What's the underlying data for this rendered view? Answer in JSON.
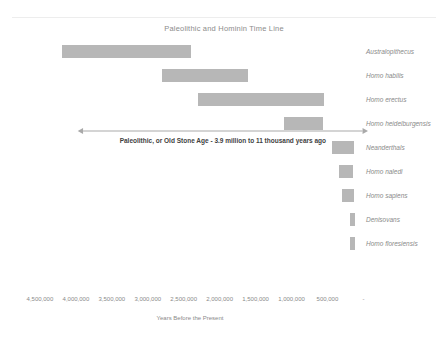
{
  "chart_data": {
    "type": "bar",
    "orientation": "horizontal-range",
    "title": "Paleolithic and Hominin Time Line",
    "xlabel": "Years Before the Present",
    "ylabel": "",
    "xlim": [
      4750000,
      -120000
    ],
    "x_reversed": true,
    "grid": false,
    "legend": "none",
    "bar_color": "#b7b7b7",
    "tick_labels": [
      "4,500,000",
      "4,000,000",
      "3,500,000",
      "3,000,000",
      "2,500,000",
      "2,000,000",
      "1,500,000",
      "1,000,000",
      "500,000",
      "-"
    ],
    "tick_values": [
      4500000,
      4000000,
      3500000,
      3000000,
      2500000,
      2000000,
      1500000,
      1000000,
      500000,
      0
    ],
    "categories": [
      "Australopithecus",
      "Homo habilis",
      "Homo erectus",
      "Homo heidelburgensis",
      "Neanderthals",
      "Homo naledi",
      "Homo sapiens",
      "Denisovans",
      "Homo floresiensis"
    ],
    "series": [
      {
        "name": "Time range (years before present)",
        "ranges": [
          {
            "label": "Australopithecus",
            "start": 4200000,
            "end": 2400000
          },
          {
            "label": "Homo habilis",
            "start": 2800000,
            "end": 1600000
          },
          {
            "label": "Homo erectus",
            "start": 2300000,
            "end": 550000
          },
          {
            "label": "Homo heidelburgensis",
            "start": 1100000,
            "end": 560000
          },
          {
            "label": "Neanderthals",
            "start": 430000,
            "end": 130000
          },
          {
            "label": "Homo naledi",
            "start": 340000,
            "end": 150000
          },
          {
            "label": "Homo sapiens",
            "start": 300000,
            "end": 130000
          },
          {
            "label": "Denisovans",
            "start": 180000,
            "end": 120000
          },
          {
            "label": "Homo floresiensis",
            "start": 190000,
            "end": 110000
          }
        ]
      }
    ],
    "annotations": [
      {
        "name": "paleolithic-span",
        "text": "Paleolithic, or Old Stone Age - 3.9 million to 11 thousand years ago",
        "start": 3900000,
        "end": 11000,
        "style": "double-headed-arrow"
      }
    ]
  }
}
